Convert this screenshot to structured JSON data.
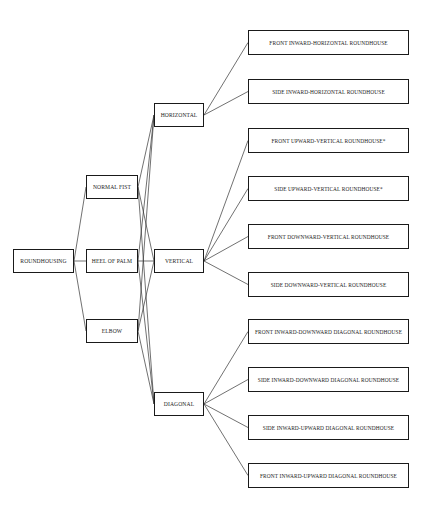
{
  "diagram": {
    "root": {
      "id": "root",
      "label": "ROUNDHOUSING",
      "box": [
        13,
        249,
        61,
        24
      ]
    },
    "strikes": [
      {
        "id": "s1",
        "label": "NORMAL FIST",
        "box": [
          86,
          175,
          52,
          24
        ]
      },
      {
        "id": "s2",
        "label": "HEEL OF PALM",
        "box": [
          86,
          249,
          52,
          24
        ]
      },
      {
        "id": "s3",
        "label": "ELBOW",
        "box": [
          86,
          319,
          52,
          24
        ]
      }
    ],
    "planes": [
      {
        "id": "p1",
        "label": "HORIZONTAL",
        "box": [
          154,
          103,
          50,
          24
        ]
      },
      {
        "id": "p2",
        "label": "VERTICAL",
        "box": [
          154,
          249,
          50,
          24
        ]
      },
      {
        "id": "p3",
        "label": "DIAGONAL",
        "box": [
          154,
          392,
          50,
          24
        ]
      }
    ],
    "techniques": [
      {
        "id": "t1",
        "label": "FRONT INWARD-HORIZONTAL ROUNDHOUSE",
        "parent": "p1",
        "box": [
          248,
          30,
          161,
          25
        ]
      },
      {
        "id": "t2",
        "label": "SIDE INWARD-HORIZONTAL ROUNDHOUSE",
        "parent": "p1",
        "box": [
          248,
          79,
          161,
          25
        ]
      },
      {
        "id": "t3",
        "label": "FRONT UPWARD-VERTICAL ROUNDHOUSE*",
        "parent": "p2",
        "box": [
          248,
          128,
          161,
          25
        ]
      },
      {
        "id": "t4",
        "label": "SIDE UPWARD-VERTICAL ROUNDHOUSE*",
        "parent": "p2",
        "box": [
          248,
          176,
          161,
          25
        ]
      },
      {
        "id": "t5",
        "label": "FRONT DOWNWARD-VERTICAL ROUNDHOUSE",
        "parent": "p2",
        "box": [
          248,
          224,
          161,
          25
        ]
      },
      {
        "id": "t6",
        "label": "SIDE DOWNWARD-VERTICAL ROUNDHOUSE",
        "parent": "p2",
        "box": [
          248,
          272,
          161,
          25
        ]
      },
      {
        "id": "t7",
        "label": "FRONT INWARD-DOWNWARD DIAGONAL ROUNDHOUSE",
        "parent": "p3",
        "box": [
          248,
          319,
          161,
          25
        ]
      },
      {
        "id": "t8",
        "label": "SIDE INWARD-DOWNWARD DIAGONAL ROUNDHOUSE",
        "parent": "p3",
        "box": [
          248,
          367,
          161,
          25
        ]
      },
      {
        "id": "t9",
        "label": "SIDE INWARD-UPWARD DIAGONAL ROUNDHOUSE",
        "parent": "p3",
        "box": [
          248,
          415,
          161,
          25
        ]
      },
      {
        "id": "t10",
        "label": "FRONT INWARD-UPWARD DIAGONAL ROUNDHOUSE",
        "parent": "p3",
        "box": [
          248,
          463,
          161,
          25
        ]
      }
    ],
    "colors": {
      "line": "#333333",
      "border": "#1a1a1a",
      "text": "#222222",
      "background": "#ffffff"
    }
  }
}
